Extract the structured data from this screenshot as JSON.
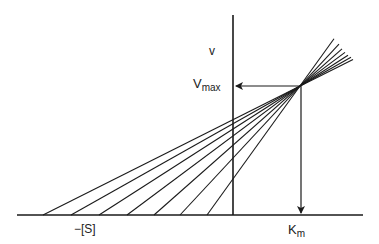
{
  "diagram": {
    "labels": {
      "y_axis": "v",
      "vmax_main": "V",
      "vmax_sub": "max",
      "x_negative": "−[S]",
      "km_main": "K",
      "km_sub": "m"
    },
    "colors": {
      "line": "#1a1a1a",
      "text": "#222222",
      "background": "#ffffff"
    },
    "geometry": {
      "baseline_y": 215,
      "baseline_x_start": 17,
      "baseline_x_end": 363,
      "axis_x": 233,
      "axis_y_top": 15,
      "intersection": {
        "x": 300,
        "y": 86
      },
      "line_origins_x": [
        43,
        71,
        99,
        127,
        154,
        180,
        207
      ],
      "line_end_x": [
        353,
        351,
        348,
        345,
        342,
        339,
        334
      ]
    }
  }
}
